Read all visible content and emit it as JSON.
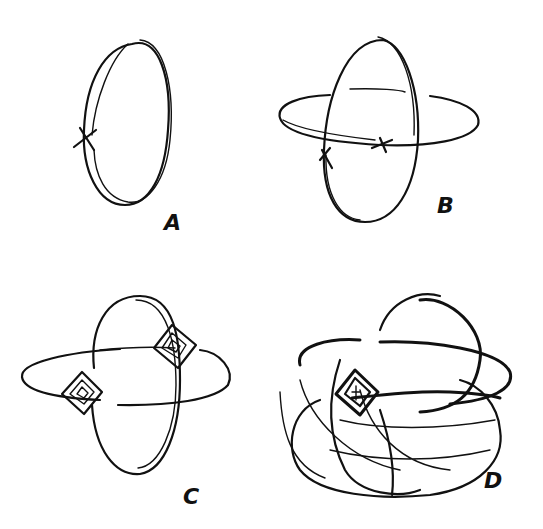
{
  "figure": {
    "ink_color": "#111111",
    "background": "#ffffff",
    "panels": [
      {
        "id": "A",
        "label": "A",
        "content": "single vertical double-stroke ellipse with a small cross mark on the left side"
      },
      {
        "id": "B",
        "label": "B",
        "content": "vertical ellipse intersected by a horizontal flat ellipse, cross marks at the intersections"
      },
      {
        "id": "C",
        "label": "C",
        "content": "vertical and horizontal ellipses joined by two diamond-shaped nested-square junctions"
      },
      {
        "id": "D",
        "label": "D",
        "content": "dense tangle of many overlapping loops forming a spherical knot with a square junction"
      }
    ]
  }
}
